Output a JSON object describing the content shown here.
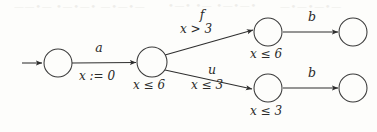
{
  "figure": {
    "kind": "timed-automaton",
    "background_color": "#fdfdfb",
    "stroke_color": "#2e2e2e",
    "text_color": "#2a2a2a"
  },
  "states": [
    {
      "id": "s0",
      "label": "",
      "invariant": "",
      "cx": 58,
      "cy": 63,
      "r": 14
    },
    {
      "id": "s1",
      "label": "",
      "invariant": "x ≤ 6",
      "cx": 152,
      "cy": 62,
      "r": 15
    },
    {
      "id": "s2",
      "label": "",
      "invariant": "x ≤ 6",
      "cx": 268,
      "cy": 32,
      "r": 14
    },
    {
      "id": "s3",
      "label": "",
      "invariant": "x ≤ 3",
      "cx": 268,
      "cy": 88,
      "r": 14
    },
    {
      "id": "s4",
      "label": "",
      "invariant": "",
      "cx": 353,
      "cy": 32,
      "r": 14
    },
    {
      "id": "s5",
      "label": "",
      "invariant": "",
      "cx": 353,
      "cy": 88,
      "r": 14
    }
  ],
  "initial_arrow": {
    "from_x": 22,
    "to_x": 43,
    "y": 63
  },
  "transitions": [
    {
      "id": "t0",
      "from": "s0",
      "to": "s1",
      "action": "a",
      "guard": "",
      "reset": "x := 0"
    },
    {
      "id": "t1",
      "from": "s1",
      "to": "s2",
      "action": "f",
      "guard": "x > 3",
      "reset": ""
    },
    {
      "id": "t2",
      "from": "s1",
      "to": "s3",
      "action": "u",
      "guard": "x ≤ 3",
      "reset": ""
    },
    {
      "id": "t3",
      "from": "s2",
      "to": "s4",
      "action": "b",
      "guard": "",
      "reset": ""
    },
    {
      "id": "t4",
      "from": "s3",
      "to": "s5",
      "action": "b",
      "guard": "",
      "reset": ""
    }
  ],
  "labels": {
    "edge_a": "a",
    "reset_a": "x := 0",
    "invariant_s1": "x ≤ 6",
    "edge_f": "f",
    "guard_f": "x > 3",
    "edge_u": "u",
    "guard_u": "x ≤ 3",
    "invariant_s2": "x ≤ 6",
    "invariant_s3": "x ≤ 3",
    "edge_b_top": "b",
    "edge_b_bottom": "b"
  }
}
